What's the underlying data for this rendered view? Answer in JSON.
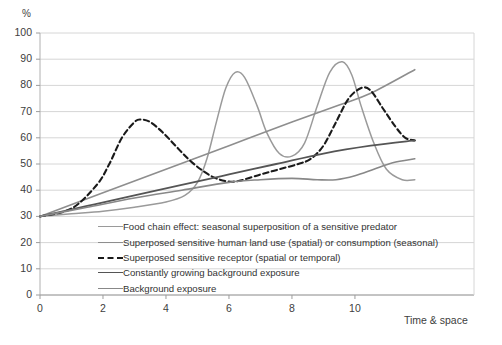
{
  "chart_data": {
    "type": "line",
    "title": "",
    "xlabel": "Time & space",
    "ylabel": "%",
    "xlim": [
      0,
      13.78
    ],
    "ylim": [
      0,
      100
    ],
    "grid": true,
    "legend_position": "inside-bottom-left",
    "xticks": [
      "0",
      "2",
      "4",
      "6",
      "8",
      "10"
    ],
    "xtick_values": [
      0,
      2,
      4,
      6,
      8,
      10
    ],
    "yticks": [
      "0",
      "10",
      "20",
      "30",
      "40",
      "50",
      "60",
      "70",
      "80",
      "90",
      "100"
    ],
    "ytick_values": [
      0,
      10,
      20,
      30,
      40,
      50,
      60,
      70,
      80,
      90,
      100
    ],
    "common_origin": {
      "x": 0,
      "y": 30
    },
    "series": [
      {
        "name": "Food chain effect: seasonal superposition of a sensitive predator",
        "color": "#9a9a9a",
        "style": "solid",
        "width": 1.5,
        "x": [
          0,
          1.0,
          2.0,
          3.0,
          4.0,
          4.6,
          5.0,
          5.3,
          5.6,
          5.9,
          6.2,
          6.5,
          6.9,
          7.2,
          7.6,
          8.0,
          8.4,
          8.8,
          9.2,
          9.6,
          9.9,
          10.2,
          10.6,
          11.0,
          11.5,
          11.9
        ],
        "y": [
          30,
          31,
          32,
          33.5,
          35.5,
          38,
          43,
          52,
          66,
          79,
          85,
          83,
          72,
          62,
          54,
          53,
          58,
          72,
          85,
          89,
          84,
          72,
          58,
          48,
          44,
          44
        ]
      },
      {
        "name": "Superposed sensitive human land use (spatial) or consumption (seasonal)",
        "color": "#8e8e8e",
        "style": "solid",
        "width": 1.6,
        "x": [
          0,
          2.0,
          4.0,
          6.0,
          8.0,
          9.5,
          10.5,
          11.9
        ],
        "y": [
          30,
          39,
          48,
          57,
          66,
          72.5,
          77,
          86
        ]
      },
      {
        "name": "Superposed sensitive receptor (spatial or temporal)",
        "color": "#1a1a1a",
        "style": "dashed",
        "width": 2.1,
        "x": [
          0,
          1.0,
          1.8,
          2.2,
          2.6,
          3.0,
          3.2,
          3.5,
          3.9,
          4.3,
          4.7,
          5.1,
          5.5,
          5.9,
          6.3,
          7.0,
          7.6,
          8.2,
          8.6,
          9.0,
          9.4,
          9.8,
          10.2,
          10.5,
          10.9,
          11.3,
          11.6,
          11.9
        ],
        "y": [
          30,
          33,
          42,
          50,
          60,
          66,
          67,
          66,
          62,
          57,
          52,
          48,
          45,
          43.5,
          43.5,
          46,
          48,
          50,
          52,
          57,
          66,
          75,
          79,
          78,
          71,
          64,
          60,
          59
        ]
      },
      {
        "name": "Constantly growing background exposure",
        "color": "#555555",
        "style": "solid",
        "width": 1.8,
        "x": [
          0,
          1.5,
          3.0,
          4.5,
          6.0,
          7.5,
          9.0,
          10.5,
          11.9
        ],
        "y": [
          30,
          34,
          38,
          42,
          46,
          50,
          54,
          57,
          59
        ]
      },
      {
        "name": "Background exposure",
        "color": "#888888",
        "style": "solid",
        "width": 1.6,
        "x": [
          0,
          1.5,
          3.0,
          4.5,
          6.0,
          7.0,
          8.0,
          8.8,
          9.4,
          10.0,
          10.6,
          11.2,
          11.9
        ],
        "y": [
          30,
          33.5,
          37,
          40,
          43,
          44,
          44.5,
          44,
          44,
          45.5,
          48,
          50.5,
          52
        ]
      }
    ]
  },
  "axes": {
    "y_unit": "%",
    "x_title": "Time & space"
  }
}
